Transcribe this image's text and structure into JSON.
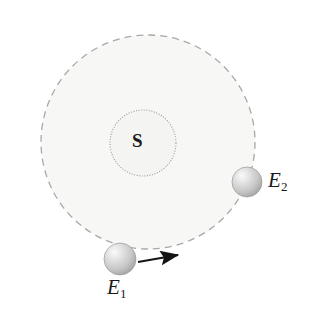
{
  "figure": {
    "background_color": "#ffffff",
    "width": 320,
    "height": 310
  },
  "orbit": {
    "name": "orbital-path",
    "shape": "circle",
    "center_x": 148,
    "center_y": 142,
    "radius": 107,
    "stroke_color": "#a8a8a8",
    "stroke_width": 1.3,
    "dash_pattern": "7 5",
    "fill_color": "#f7f7f5"
  },
  "sun": {
    "name": "sun",
    "label": "S",
    "center_x": 143,
    "center_y": 143,
    "radius": 33,
    "stroke_color": "#9a9a9a",
    "stroke_width": 1.1,
    "dash_pattern": "1 1.6",
    "fill_color": "#f4f4f2"
  },
  "bodies": [
    {
      "name": "earth-position-1",
      "label": "E",
      "subscript": "1",
      "center_x": 120,
      "center_y": 259,
      "radius": 16,
      "highlight_color": "#f2f2f2",
      "mid_color": "#cccccc",
      "edge_color": "#9d9d9d"
    },
    {
      "name": "earth-position-2",
      "label": "E",
      "subscript": "2",
      "center_x": 247,
      "center_y": 182,
      "radius": 15,
      "highlight_color": "#f2f2f2",
      "mid_color": "#cccccc",
      "edge_color": "#9d9d9d"
    }
  ],
  "direction_arrow": {
    "name": "orbit-direction-arrow",
    "x1": 138,
    "y1": 262,
    "x2": 178,
    "y2": 255,
    "stroke_color": "#141414",
    "stroke_width": 2.1
  }
}
